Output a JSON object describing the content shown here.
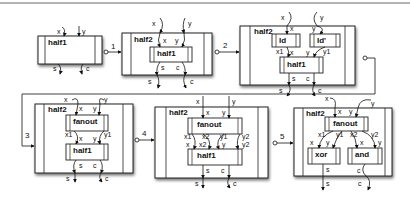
{
  "diagram": {
    "colors": {
      "background": "#ffffff",
      "stroke": "#222222",
      "box_fill": "#ffffff",
      "shadow": "#999999",
      "top_rule": "#9a9a9a"
    },
    "steps": [
      {
        "id": 1,
        "label": "1"
      },
      {
        "id": 2,
        "label": "2"
      },
      {
        "id": 3,
        "label": "3"
      },
      {
        "id": 4,
        "label": "4"
      },
      {
        "id": 5,
        "label": "5"
      }
    ],
    "panels": [
      {
        "name": "panel-1",
        "outer": {
          "title": "half1"
        },
        "inputs": [
          "x",
          "y"
        ],
        "outputs": [
          "s",
          "c"
        ]
      },
      {
        "name": "panel-2",
        "outer": {
          "title": "half2"
        },
        "inner": [
          {
            "title": "half1"
          }
        ],
        "outer_ports": {
          "in": [
            "x",
            "y"
          ],
          "out": [
            "s",
            "c"
          ]
        },
        "inner_ports": {
          "in": [
            "x",
            "y"
          ],
          "out": [
            "s",
            "c"
          ]
        }
      },
      {
        "name": "panel-3",
        "outer": {
          "title": "half2"
        },
        "inner": [
          {
            "title": "Id"
          },
          {
            "title": "Id'"
          },
          {
            "title": "half1"
          }
        ],
        "outer_ports": {
          "in": [
            "x",
            "y"
          ],
          "out": [
            "s",
            "c"
          ]
        },
        "wire_labels": [
          "x",
          "y",
          "x1",
          "x",
          "y",
          "y1",
          "s",
          "c"
        ]
      },
      {
        "name": "panel-4",
        "outer": {
          "title": "half2"
        },
        "inner": [
          {
            "title": "fanout"
          },
          {
            "title": "half1"
          }
        ],
        "outer_ports": {
          "in": [
            "x",
            "y"
          ],
          "out": [
            "s",
            "c"
          ]
        },
        "wire_labels": [
          "x",
          "y",
          "x1",
          "x",
          "y",
          "y1",
          "s",
          "c"
        ]
      },
      {
        "name": "panel-5",
        "outer": {
          "title": "half2"
        },
        "inner": [
          {
            "title": "fanout"
          },
          {
            "title": "half1"
          }
        ],
        "outer_ports": {
          "in": [
            "x",
            "y"
          ],
          "out": [
            "s",
            "c"
          ]
        },
        "wire_labels": [
          "x",
          "y",
          "x1",
          "x2",
          "y1",
          "y2",
          "x",
          "x2",
          "y",
          "y2",
          "s",
          "c"
        ]
      },
      {
        "name": "panel-6",
        "outer": {
          "title": "half2"
        },
        "inner": [
          {
            "title": "fanout"
          },
          {
            "title": "xor"
          },
          {
            "title": "and"
          }
        ],
        "outer_ports": {
          "in": [
            "x",
            "y"
          ],
          "out": [
            "s",
            "c"
          ]
        },
        "wire_labels": [
          "x",
          "y",
          "x1",
          "y1",
          "x2",
          "y2",
          "x",
          "y",
          "x",
          "y",
          "s",
          "c"
        ]
      }
    ],
    "text": {
      "half1": "half1",
      "half2": "half2",
      "id": "Id",
      "id_prime": "Id'",
      "fanout": "fanout",
      "xor": "xor",
      "and": "and",
      "x": "x",
      "y": "y",
      "s": "s",
      "c": "c",
      "x1": "x1",
      "x2": "x2",
      "y1": "y1",
      "y2": "y2"
    }
  }
}
